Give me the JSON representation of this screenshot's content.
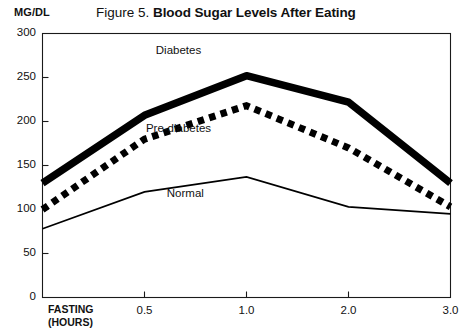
{
  "figure": {
    "title_prefix": "Figure 5.",
    "title_main": "Blood Sugar Levels After Eating",
    "y_unit_label": "MG/DL"
  },
  "chart_data": {
    "type": "line",
    "title": "Figure 5. Blood Sugar Levels After Eating",
    "xlabel": "FASTING (HOURS)",
    "ylabel": "MG/DL",
    "categories": [
      "FASTING",
      "0.5",
      "1.0",
      "2.0",
      "3.0"
    ],
    "x": [
      0,
      0.5,
      1.0,
      2.0,
      3.0
    ],
    "ylim": [
      0,
      300
    ],
    "yticks": [
      0,
      50,
      100,
      150,
      200,
      250,
      300
    ],
    "ytick_labels": [
      "0",
      "50",
      "100",
      "150",
      "200",
      "250",
      "300"
    ],
    "xtick_labels": [
      "FASTING",
      "0.5",
      "1.0",
      "2.0",
      "3.0"
    ],
    "grid": false,
    "legend": "inline-annotations",
    "series": [
      {
        "name": "Diabetes",
        "style": "thick-solid",
        "color": "#000000",
        "values": [
          130,
          207,
          252,
          222,
          130
        ]
      },
      {
        "name": "Pre-diabetes",
        "style": "thick-dashed",
        "color": "#000000",
        "values": [
          100,
          180,
          218,
          170,
          103
        ]
      },
      {
        "name": "Normal",
        "style": "thin-solid",
        "color": "#000000",
        "values": [
          78,
          120,
          137,
          103,
          95
        ]
      }
    ],
    "annotations": [
      {
        "text": "Diabetes",
        "x": 1.0,
        "y": 280
      },
      {
        "text": "Pre-diabetes",
        "x": 1.0,
        "y": 192
      },
      {
        "text": "Normal",
        "x": 1.05,
        "y": 118
      }
    ]
  },
  "axis": {
    "x_title_line1": "FASTING",
    "x_title_line2": "(HOURS)"
  }
}
